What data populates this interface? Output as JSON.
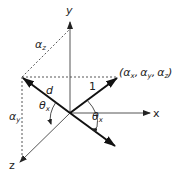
{
  "diagram": {
    "axes": {
      "x_label": "x",
      "y_label": "y",
      "z_label": "z"
    },
    "vectors": {
      "unit_label": "1",
      "d_label": "d"
    },
    "point_label": {
      "open": "(",
      "ax": "α",
      "ax_sub": "x",
      "sep1": ",",
      "ay": "α",
      "ay_sub": "y",
      "sep2": ",",
      "az": "α",
      "az_sub": "z",
      "close": ")"
    },
    "components": {
      "alpha_z": "α",
      "alpha_z_sub": "z",
      "alpha_y": "α",
      "alpha_y_sub": "y"
    },
    "angles": {
      "theta_left": "θ",
      "theta_left_sub": "x",
      "theta_right": "θ",
      "theta_right_sub": "x"
    },
    "colors": {
      "line": "#222222",
      "dashed": "#444444",
      "axis": "#555555"
    }
  }
}
